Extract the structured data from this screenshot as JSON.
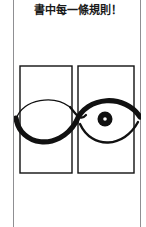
{
  "page": {
    "width": 146,
    "height": 227,
    "background_color": "#ffffff",
    "ink_color": "#111111",
    "rule_color": "#8f8f92"
  },
  "caption": {
    "text": "書中每一條規則！",
    "language": "zh-Hant",
    "translation_note": "Every single rule in the book!",
    "align": "center",
    "weight": "bold"
  },
  "margin_rules": [
    {
      "name": "left-page-rule",
      "x": 13
    },
    {
      "name": "right-page-rule",
      "x": 140
    }
  ],
  "illustration": {
    "title": "two-panel eye and lens diagram",
    "description": "A continuous sinuous brush curve spans two bordered rectangular panels, forming a closed lens shape in the left panel and an eye shape containing a pupil in the right panel.",
    "panels": [
      {
        "name": "left-panel",
        "label": "",
        "contains": "lens-shape",
        "has_pupil": false,
        "x": 6,
        "y": 4,
        "width": 52,
        "height": 107
      },
      {
        "name": "right-panel",
        "label": "",
        "contains": "eye-shape",
        "has_pupil": true,
        "x": 64,
        "y": 4,
        "width": 56,
        "height": 107
      }
    ],
    "pupil": {
      "name": "pupil",
      "center_x": 91,
      "center_y": 57,
      "outer_radius": 7.5,
      "highlight_radius": 1.8,
      "color": "#111111",
      "highlight_color": "#ffffff"
    },
    "stroke": {
      "color": "#111111",
      "panel_border_width": 1.4,
      "curve_thick": 5,
      "curve_thin": 1.2
    }
  }
}
